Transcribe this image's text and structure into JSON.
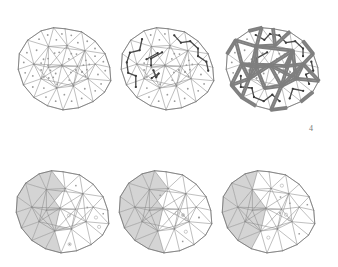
{
  "figure": {
    "label": "4",
    "background_color": "#ffffff",
    "panel_count": 6,
    "rows": 2,
    "columns": 3
  },
  "style": {
    "mesh_edge_color": "#8a8a8a",
    "mesh_edge_width": 0.55,
    "outline_color": "#6e6e6e",
    "outline_width": 0.7,
    "centroid_dot_color": "#9a9a9a",
    "centroid_dot_radius": 0.9,
    "tree_edge_color": "#4a4a4a",
    "tree_edge_width": 1.35,
    "tree_node_color": "#3c3c3c",
    "tree_node_radius": 1.1,
    "cut_edge_color": "#7f7f7f",
    "cut_edge_width": 1.9,
    "shade_fill_color": "#d4d4d4",
    "shade_stroke_color": "#8a8a8a",
    "marker_circle_color": "#9a9a9a"
  },
  "panels": [
    {
      "id": "panel-top-left",
      "name": "triangulated-polyhedron-base",
      "row": 1,
      "column": 1,
      "cx": 64,
      "cy": 61,
      "radius": 52,
      "shows_centroids": true,
      "shows_tree": false,
      "shows_cuts": false,
      "shows_shading": false,
      "shows_markers": false
    },
    {
      "id": "panel-top-middle",
      "name": "spanning-tree-overlay",
      "row": 1,
      "column": 2,
      "cx": 167,
      "cy": 61,
      "radius": 52,
      "shows_centroids": true,
      "shows_tree": true,
      "shows_cuts": false,
      "shows_shading": false,
      "shows_markers": false
    },
    {
      "id": "panel-top-right",
      "name": "cut-edges-unfolding",
      "row": 1,
      "column": 3,
      "cx": 272,
      "cy": 61,
      "radius": 52,
      "shows_centroids": true,
      "shows_tree": true,
      "shows_cuts": true,
      "shows_shading": false,
      "shows_markers": false
    },
    {
      "id": "panel-bottom-left",
      "name": "shaded-patch-step-one",
      "row": 2,
      "column": 1,
      "cx": 62,
      "cy": 204,
      "radius": 52,
      "shows_centroids": false,
      "shows_tree": false,
      "shows_cuts": false,
      "shows_shading": true,
      "shows_markers": true,
      "shade_extent": 0.52
    },
    {
      "id": "panel-bottom-middle",
      "name": "shaded-patch-step-two",
      "row": 2,
      "column": 2,
      "cx": 165,
      "cy": 204,
      "radius": 52,
      "shows_centroids": false,
      "shows_tree": false,
      "shows_cuts": false,
      "shows_shading": true,
      "shows_markers": true,
      "shade_extent": 0.5
    },
    {
      "id": "panel-bottom-right",
      "name": "shaded-patch-step-three",
      "row": 2,
      "column": 3,
      "cx": 268,
      "cy": 204,
      "radius": 52,
      "shows_centroids": false,
      "shows_tree": false,
      "shows_cuts": false,
      "shows_shading": true,
      "shows_markers": true,
      "shade_extent": 0.46
    }
  ],
  "mesh": {
    "description": "convex polyhedron projected to plane, triangulated, approx 20 boundary vertices",
    "boundary_vertex_count": 17,
    "interior_vertex_count": 12,
    "triangle_count": 44,
    "boundary": [
      [
        0.02,
        -0.62
      ],
      [
        0.34,
        -0.56
      ],
      [
        0.6,
        -0.38
      ],
      [
        0.79,
        -0.14
      ],
      [
        0.88,
        0.12
      ],
      [
        0.9,
        0.38
      ],
      [
        0.78,
        0.6
      ],
      [
        0.56,
        0.78
      ],
      [
        0.28,
        0.9
      ],
      [
        -0.02,
        0.94
      ],
      [
        -0.32,
        0.86
      ],
      [
        -0.58,
        0.7
      ],
      [
        -0.78,
        0.46
      ],
      [
        -0.88,
        0.16
      ],
      [
        -0.86,
        -0.14
      ],
      [
        -0.7,
        -0.4
      ],
      [
        -0.44,
        -0.58
      ],
      [
        -0.2,
        -0.64
      ]
    ],
    "interior": [
      [
        -0.3,
        -0.28
      ],
      [
        0.06,
        -0.3
      ],
      [
        0.4,
        -0.2
      ],
      [
        0.6,
        0.06
      ],
      [
        0.46,
        0.34
      ],
      [
        0.18,
        0.48
      ],
      [
        -0.14,
        0.52
      ],
      [
        -0.44,
        0.34
      ],
      [
        -0.58,
        0.06
      ],
      [
        -0.04,
        0.08
      ],
      [
        0.26,
        0.1
      ],
      [
        -0.3,
        0.12
      ]
    ]
  },
  "shaded_region": {
    "name": "highlighted-triangle-patch",
    "location": "left-portion-of-mesh",
    "fill": "#d4d4d4"
  },
  "markers": {
    "open_circle_count": 4,
    "filled_square_count": 5
  }
}
